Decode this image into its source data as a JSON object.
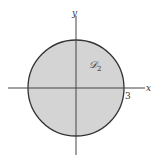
{
  "diagram": {
    "region_label": "𝒟",
    "region_subscript": "2",
    "x_axis_label": "x",
    "y_axis_label": "y",
    "radius_tick_label": "3",
    "fill_color": "#d4d4d4",
    "stroke_color": "#333333",
    "axis_color": "#444444"
  }
}
